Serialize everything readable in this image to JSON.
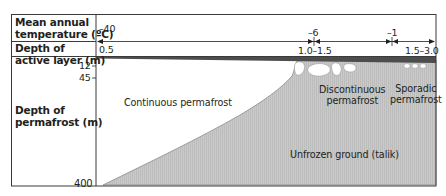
{
  "diagram": {
    "row_labels": {
      "temperature": "Mean annual temperature (°C)",
      "temperature_line1": "Mean annual",
      "temperature_line2": "temperature (ºC)",
      "active_layer": "Depth of active layer (m)",
      "active_layer_line1": "Depth of",
      "active_layer_line2": "active layer (m)",
      "permafrost_depth": "Depth of permafrost (m)",
      "permafrost_depth_line1": "Depth of",
      "permafrost_depth_line2": "permafrost (m)"
    },
    "temperatures": [
      {
        "value": "–40",
        "position": "left"
      },
      {
        "value": "–6",
        "position": "discontinuous boundary"
      },
      {
        "value": "–1",
        "position": "sporadic boundary"
      }
    ],
    "active_layer_depths": [
      {
        "value": "0.5",
        "position": "left"
      },
      {
        "value": "1.0–1.5",
        "position": "discontinuous boundary"
      },
      {
        "value": "1.5–3.0",
        "position": "right"
      }
    ],
    "depth_ticks": [
      {
        "value": "12"
      },
      {
        "value": "45"
      },
      {
        "value": "400"
      }
    ],
    "regions": {
      "continuous": "Continuous permafrost",
      "discontinuous_line1": "Discontinuous",
      "discontinuous_line2": "permafrost",
      "sporadic_line1": "Sporadic",
      "sporadic_line2": "permafrost",
      "unfrozen": "Unfrozen ground (talik)"
    },
    "colors": {
      "border": "#3a3a3a",
      "active_layer": "#4a4a4a",
      "unfrozen_fill": "#c8c8c8",
      "frozen_fill": "#ffffff",
      "text": "#231f20"
    }
  }
}
